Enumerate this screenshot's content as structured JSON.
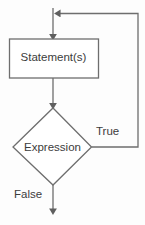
{
  "diagram": {
    "type": "flowchart",
    "background_color": "#fdfdfd",
    "line_color": "#6e6e6e",
    "text_color": "#3c3c3c",
    "nodes": {
      "statement": {
        "label": "Statement(s)",
        "shape": "rectangle"
      },
      "expression": {
        "label": "Expression",
        "shape": "diamond"
      }
    },
    "edges": {
      "true_branch": {
        "label": "True"
      },
      "false_branch": {
        "label": "False"
      }
    }
  }
}
